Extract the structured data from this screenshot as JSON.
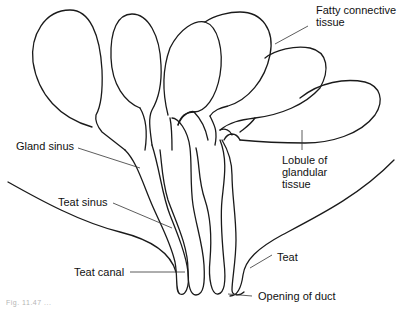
{
  "diagram": {
    "type": "anatomical-line-drawing",
    "labels": {
      "fatty_connective_tissue": "Fatty connective\ntissue",
      "gland_sinus": "Gland sinus",
      "lobule": "Lobule of\nglandular\ntissue",
      "teat_sinus": "Teat sinus",
      "teat_canal": "Teat canal",
      "teat": "Teat",
      "opening_of_duct": "Opening of duct"
    },
    "caption": "Fig. 11.47 ..."
  },
  "colors": {
    "line": "#1a1a1a",
    "background": "#ffffff"
  }
}
